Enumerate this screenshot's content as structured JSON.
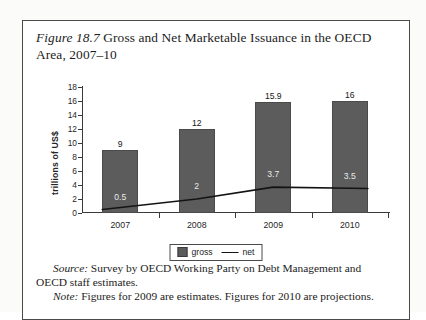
{
  "figure": {
    "label": "Figure 18.7",
    "title_rest": " Gross and Net Marketable Issuance in the OECD Area, 2007–10",
    "source_lead": "Source:",
    "source_text": " Survey by OECD Working Party on Debt Management and OECD staff estimates.",
    "note_lead": "Note:",
    "note_text": " Figures for 2009 are estimates. Figures for 2010 are projections."
  },
  "legend": {
    "gross_label": "gross",
    "net_label": "net"
  },
  "colors": {
    "bar_fill": "#5c5c5c",
    "bar_stroke": "#4a4a4a",
    "net_line": "#141414",
    "axis": "#3a3a3a",
    "frame": "#4a4a4a",
    "page": "#fbfbfa",
    "inner_label_text": "#e9e9e9"
  },
  "chart_data": {
    "type": "bar",
    "title": "Figure 18.7 Gross and Net Marketable Issuance in the OECD Area, 2007–10",
    "xlabel": "",
    "ylabel": "trillions of US$",
    "ylim": [
      0,
      18
    ],
    "yticks": [
      0,
      2,
      4,
      6,
      8,
      10,
      12,
      14,
      16,
      18
    ],
    "ytick_labels": [
      "0",
      "2",
      "4",
      "6",
      "8",
      "10",
      "12",
      "14",
      "16",
      "18"
    ],
    "grid": false,
    "legend_position": "bottom-center",
    "categories": [
      "2007",
      "2008",
      "2009",
      "2010"
    ],
    "series": [
      {
        "name": "gross",
        "type": "bar",
        "values": [
          9,
          12,
          15.9,
          16
        ],
        "labels": [
          "9",
          "12",
          "15.9",
          "16"
        ]
      },
      {
        "name": "net",
        "type": "line",
        "values": [
          0.5,
          2,
          3.7,
          3.5
        ],
        "labels": [
          "0.5",
          "2",
          "3.7",
          "3.5"
        ]
      }
    ]
  }
}
